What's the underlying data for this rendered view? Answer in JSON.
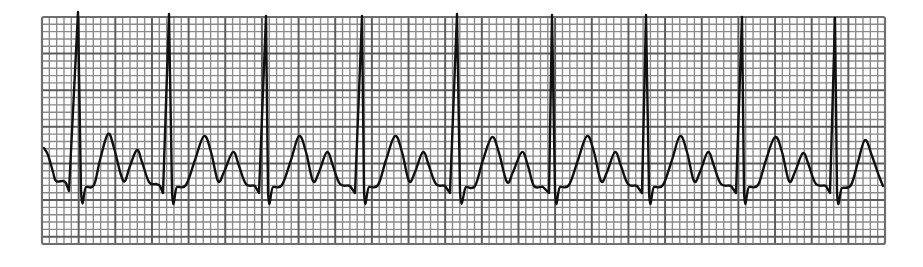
{
  "chart_data": {
    "type": "line",
    "xlabel": "",
    "ylabel": "",
    "grid": true,
    "grid_spec": {
      "left": 42,
      "top": 17,
      "right": 885,
      "bottom": 244,
      "minor_px": 7.33,
      "minor_per_major": 5,
      "colors": {
        "minor": "#8a8a8a",
        "major": "#5c5c5c",
        "background": "#ffffff"
      }
    },
    "trace_color": "#111111",
    "r_peaks_x": [
      78,
      169,
      266,
      362,
      457,
      552,
      646,
      742,
      835
    ],
    "beat_count": 9,
    "series": [
      {
        "name": "Lead",
        "points": [
          [
            44,
            148
          ],
          [
            48,
            155
          ],
          [
            53,
            172
          ],
          [
            56,
            181
          ],
          [
            63,
            181
          ],
          [
            66,
            183
          ],
          [
            69,
            191
          ],
          [
            78,
            12
          ],
          [
            81,
            190
          ],
          [
            86,
            187
          ],
          [
            94,
            185
          ],
          [
            100,
            160
          ],
          [
            108,
            134
          ],
          [
            114,
            148
          ],
          [
            121,
            175
          ],
          [
            125,
            181
          ],
          [
            130,
            166
          ],
          [
            137,
            150
          ],
          [
            142,
            162
          ],
          [
            149,
            182
          ],
          [
            156,
            184
          ],
          [
            160,
            186
          ],
          [
            163,
            193
          ],
          [
            169,
            14
          ],
          [
            172,
            191
          ],
          [
            177,
            187
          ],
          [
            186,
            185
          ],
          [
            195,
            160
          ],
          [
            204,
            136
          ],
          [
            211,
            152
          ],
          [
            218,
            181
          ],
          [
            224,
            172
          ],
          [
            233,
            152
          ],
          [
            239,
            166
          ],
          [
            246,
            184
          ],
          [
            255,
            186
          ],
          [
            259,
            193
          ],
          [
            266,
            16
          ],
          [
            268,
            191
          ],
          [
            273,
            187
          ],
          [
            282,
            185
          ],
          [
            291,
            160
          ],
          [
            299,
            136
          ],
          [
            306,
            152
          ],
          [
            313,
            181
          ],
          [
            319,
            172
          ],
          [
            327,
            152
          ],
          [
            333,
            166
          ],
          [
            340,
            184
          ],
          [
            350,
            186
          ],
          [
            355,
            193
          ],
          [
            362,
            16
          ],
          [
            364,
            191
          ],
          [
            369,
            187
          ],
          [
            378,
            185
          ],
          [
            386,
            160
          ],
          [
            395,
            136
          ],
          [
            402,
            152
          ],
          [
            409,
            181
          ],
          [
            415,
            172
          ],
          [
            423,
            152
          ],
          [
            429,
            166
          ],
          [
            436,
            184
          ],
          [
            445,
            186
          ],
          [
            450,
            193
          ],
          [
            457,
            14
          ],
          [
            460,
            191
          ],
          [
            466,
            187
          ],
          [
            475,
            186
          ],
          [
            483,
            160
          ],
          [
            492,
            137
          ],
          [
            499,
            153
          ],
          [
            507,
            182
          ],
          [
            513,
            172
          ],
          [
            522,
            152
          ],
          [
            528,
            166
          ],
          [
            534,
            186
          ],
          [
            543,
            187
          ],
          [
            549,
            193
          ],
          [
            552,
            15
          ],
          [
            555,
            191
          ],
          [
            560,
            187
          ],
          [
            569,
            185
          ],
          [
            578,
            160
          ],
          [
            587,
            136
          ],
          [
            594,
            152
          ],
          [
            601,
            181
          ],
          [
            607,
            172
          ],
          [
            615,
            152
          ],
          [
            621,
            166
          ],
          [
            628,
            184
          ],
          [
            637,
            186
          ],
          [
            642,
            193
          ],
          [
            646,
            15
          ],
          [
            649,
            191
          ],
          [
            654,
            187
          ],
          [
            663,
            185
          ],
          [
            672,
            160
          ],
          [
            680,
            136
          ],
          [
            687,
            152
          ],
          [
            694,
            181
          ],
          [
            700,
            172
          ],
          [
            708,
            152
          ],
          [
            714,
            166
          ],
          [
            721,
            184
          ],
          [
            731,
            186
          ],
          [
            736,
            193
          ],
          [
            742,
            17
          ],
          [
            744,
            191
          ],
          [
            749,
            187
          ],
          [
            758,
            185
          ],
          [
            766,
            160
          ],
          [
            775,
            137
          ],
          [
            782,
            152
          ],
          [
            789,
            181
          ],
          [
            795,
            172
          ],
          [
            803,
            153
          ],
          [
            809,
            166
          ],
          [
            816,
            184
          ],
          [
            826,
            186
          ],
          [
            830,
            193
          ],
          [
            835,
            18
          ],
          [
            837,
            191
          ],
          [
            842,
            188
          ],
          [
            851,
            185
          ],
          [
            858,
            162
          ],
          [
            865,
            140
          ],
          [
            872,
            156
          ],
          [
            879,
            176
          ],
          [
            883,
            186
          ]
        ]
      }
    ]
  },
  "strip": {
    "label": "Cardiac rhythm strip"
  }
}
